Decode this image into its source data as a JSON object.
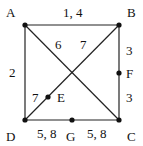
{
  "graph": {
    "nodes": [
      {
        "id": "A",
        "label": "A",
        "x": 25,
        "y": 25,
        "lx": 6,
        "ly": 6
      },
      {
        "id": "B",
        "label": "B",
        "x": 119,
        "y": 25,
        "lx": 127,
        "ly": 6
      },
      {
        "id": "C",
        "label": "C",
        "x": 119,
        "y": 120,
        "lx": 127,
        "ly": 130
      },
      {
        "id": "D",
        "label": "D",
        "x": 25,
        "y": 120,
        "lx": 6,
        "ly": 130
      },
      {
        "id": "E",
        "label": "E",
        "x": 48,
        "y": 97,
        "lx": 57,
        "ly": 91
      },
      {
        "id": "F",
        "label": "F",
        "x": 119,
        "y": 73,
        "lx": 126,
        "ly": 67
      },
      {
        "id": "G",
        "label": "G",
        "x": 72,
        "y": 120,
        "lx": 66,
        "ly": 130
      }
    ],
    "edges": [
      {
        "from": "A",
        "to": "B",
        "weight": "1, 4",
        "lx": 64,
        "ly": 6
      },
      {
        "from": "A",
        "to": "C",
        "weight": "6",
        "lx": 55,
        "ly": 38
      },
      {
        "from": "D",
        "to": "B",
        "weight": "7",
        "lx": 79,
        "ly": 38
      },
      {
        "from": "A",
        "to": "D",
        "weight": "2",
        "lx": 9,
        "ly": 67
      },
      {
        "from": "B",
        "to": "F",
        "weight": "3",
        "lx": 126,
        "ly": 44
      },
      {
        "from": "F",
        "to": "C",
        "weight": "3",
        "lx": 126,
        "ly": 91
      },
      {
        "from": "D",
        "to": "G",
        "weight": "5, 8",
        "lx": 37,
        "ly": 128
      },
      {
        "from": "G",
        "to": "C",
        "weight": "5, 8",
        "lx": 87,
        "ly": 128
      },
      {
        "from": "D",
        "to": "E",
        "weight": "7",
        "lx": 32,
        "ly": 91
      }
    ]
  }
}
